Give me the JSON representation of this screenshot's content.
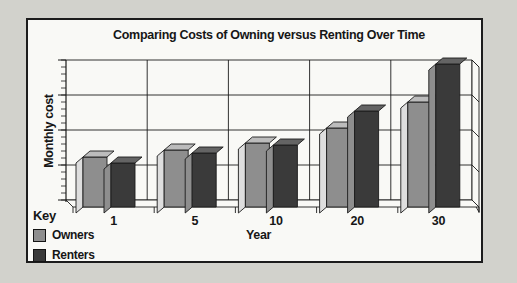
{
  "title": "Comparing Costs of Owning versus Renting Over Time",
  "legend": {
    "heading": "Key",
    "items": [
      {
        "label": "Owners"
      },
      {
        "label": "Renters"
      }
    ]
  },
  "chart_data": {
    "type": "bar",
    "style": "pseudo-3d-grouped-bars",
    "title": "Comparing Costs of Owning versus Renting Over Time",
    "xlabel": "Year",
    "ylabel": "Monthly cost",
    "categories": [
      "1",
      "5",
      "10",
      "20",
      "30"
    ],
    "series": [
      {
        "name": "Owners",
        "values": [
          50,
          57,
          64,
          79,
          105
        ],
        "colors": {
          "front": "#8e8e8e",
          "top": "#bcbcbc",
          "side": "#dedede"
        }
      },
      {
        "name": "Renters",
        "values": [
          44,
          54,
          62,
          96,
          143
        ],
        "colors": {
          "front": "#3a3a3a",
          "top": "#646464",
          "side": "#8e8e8e"
        }
      }
    ],
    "y_axis": {
      "numeric_labels_shown": false,
      "units": "relative monthly cost",
      "ylim": [
        0,
        147
      ],
      "minor_ticks": true,
      "major_divisions": 4
    },
    "grid": true,
    "legend_position": "bottom-left"
  },
  "colors": {
    "background": "#d2d2cc",
    "panel": "#f9f9f6",
    "line": "#1c1c1c",
    "text": "#161616"
  }
}
